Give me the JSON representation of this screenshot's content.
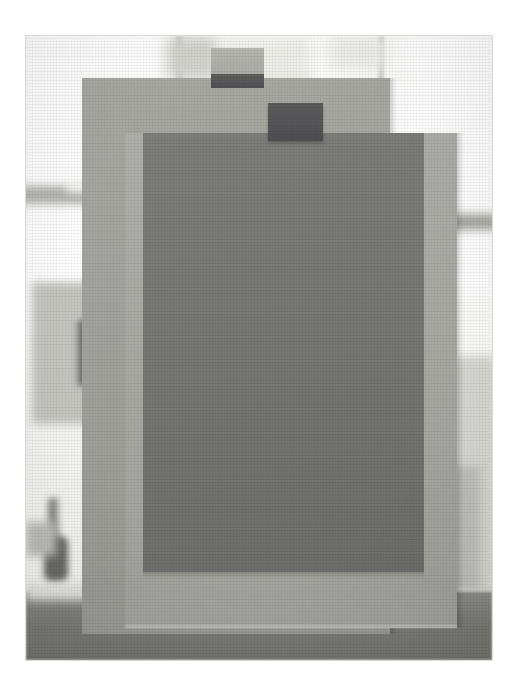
{
  "image": {
    "kind": "photograph",
    "title": "Stacked grey paper sheets taped in front of a bright window",
    "frame": {
      "x": 26,
      "y": 36,
      "width": 466,
      "height": 624,
      "border_color": "#d9d9d6"
    },
    "canvas": {
      "width": 520,
      "height": 696,
      "background": "#ffffff"
    }
  },
  "palette": {
    "paper_light": "#a6a6a1",
    "paper_light_2": "#adada8",
    "paper_dark": "#77777 3",
    "paper_dark_hex": "#777773",
    "tape_light": "#b3b3ae",
    "tape_dark": "#56565a",
    "floor": "#7e7e7a",
    "window_white": "#ffffff",
    "background_haze": "#e8e8e3"
  },
  "background": {
    "label": "blurred interior with bright window panes",
    "panes": [
      {
        "name": "left-pane",
        "x": 0,
        "y": 0,
        "width": 150,
        "height": 300
      },
      {
        "name": "centre-pane",
        "x": 182,
        "y": 0,
        "width": 120,
        "height": 90
      },
      {
        "name": "right-pane",
        "x": 382,
        "y": 0,
        "width": 84,
        "height": 260
      }
    ],
    "mullions": [
      {
        "name": "mullion-left",
        "x": 150,
        "y": 0,
        "width": 7,
        "height": 210
      },
      {
        "name": "mullion-right",
        "x": 355,
        "y": 0,
        "width": 6,
        "height": 120
      }
    ],
    "objects": [
      {
        "name": "shelf-bracket-left",
        "x": 0,
        "y": 150,
        "width": 108,
        "height": 20,
        "color": "#b9b9b4"
      },
      {
        "name": "pale-box-left",
        "x": 8,
        "y": 246,
        "width": 120,
        "height": 140,
        "color": "#c4c4bf"
      },
      {
        "name": "dark-patch-left",
        "x": 52,
        "y": 286,
        "width": 54,
        "height": 62,
        "color": "#6b6b68"
      },
      {
        "name": "shelf-bracket-right",
        "x": 392,
        "y": 180,
        "width": 74,
        "height": 18,
        "color": "#aaaaa5"
      },
      {
        "name": "dark-patch-right",
        "x": 400,
        "y": 268,
        "width": 26,
        "height": 56,
        "color": "#5f5f5d"
      },
      {
        "name": "pale-column-right",
        "x": 392,
        "y": 326,
        "width": 74,
        "height": 230,
        "color": "#d6d6d1"
      },
      {
        "name": "tool-silhouette",
        "x": 20,
        "y": 458,
        "width": 30,
        "height": 86,
        "color": "#6e6e6b"
      }
    ],
    "floor": {
      "name": "table-surface",
      "y": 556,
      "height": 68,
      "color": "#7e7e7a"
    }
  },
  "sheets": [
    {
      "id": "sheet-back-light",
      "label": "large light grey sheet (back)",
      "x": 82,
      "y": 78,
      "width": 308,
      "height": 520,
      "color": "#a6a6a1"
    },
    {
      "id": "sheet-mid-light",
      "label": "light grey sheet (middle, offset right and down)",
      "x": 125,
      "y": 133,
      "width": 332,
      "height": 495,
      "color": "#adada8"
    },
    {
      "id": "sheet-front-dark",
      "label": "dark grey sheet (front)",
      "x": 143,
      "y": 133,
      "width": 281,
      "height": 439,
      "color": "#777773"
    }
  ],
  "tape_pieces": [
    {
      "id": "tape-top-left",
      "label": "masking tape strip over top edge of back sheet",
      "x": 211,
      "y": 48,
      "width": 53,
      "height": 40,
      "upper_color": "#b3b3ae",
      "lower_color": "#57575a"
    },
    {
      "id": "tape-top-right",
      "label": "dark tape strip over top edge of front sheet",
      "x": 268,
      "y": 103,
      "width": 55,
      "height": 38,
      "color": "#56565a"
    }
  ]
}
